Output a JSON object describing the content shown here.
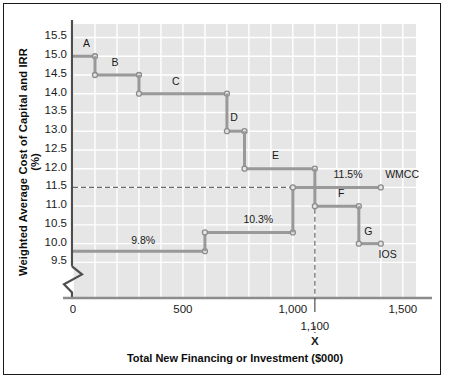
{
  "chart_data": {
    "type": "line",
    "title": "",
    "xlabel": "Total New Financing or Investment ($000)",
    "ylabel": "Weighted Average Cost of Capital and IRR (%)",
    "xlim": [
      0,
      1560
    ],
    "ylim": [
      9.3,
      15.7
    ],
    "xticks": [
      "0",
      "500",
      "1,000",
      "1,500"
    ],
    "xtick_values": [
      0,
      500,
      1000,
      1500
    ],
    "yticks": [
      "9.5",
      "10.0",
      "10.5",
      "11.0",
      "11.5",
      "12.0",
      "12.5",
      "13.0",
      "13.5",
      "14.0",
      "14.5",
      "15.0",
      "15.5"
    ],
    "ytick_values": [
      9.5,
      10.0,
      10.5,
      11.0,
      11.5,
      12.0,
      12.5,
      13.0,
      13.5,
      14.0,
      14.5,
      15.0,
      15.5
    ],
    "grid": true,
    "axis_break": true,
    "legend": "none",
    "series": [
      {
        "name": "IOS",
        "label": "IOS",
        "type": "step-down",
        "color": "#999999",
        "steps": [
          {
            "id": "A",
            "irr": 15.0,
            "x_start": 0,
            "x_end": 100
          },
          {
            "id": "B",
            "irr": 14.5,
            "x_start": 100,
            "x_end": 300
          },
          {
            "id": "C",
            "irr": 14.0,
            "x_start": 300,
            "x_end": 700
          },
          {
            "id": "D",
            "irr": 13.0,
            "x_start": 700,
            "x_end": 780
          },
          {
            "id": "E",
            "irr": 12.0,
            "x_start": 780,
            "x_end": 1100
          },
          {
            "id": "F",
            "irr": 11.0,
            "x_start": 1100,
            "x_end": 1300
          },
          {
            "id": "G",
            "irr": 10.0,
            "x_start": 1300,
            "x_end": 1400
          }
        ]
      },
      {
        "name": "WMCC",
        "label": "WMCC",
        "type": "step-up",
        "color": "#999999",
        "steps": [
          {
            "rate": 9.8,
            "rate_label": "9.8%",
            "x_start": 0,
            "x_end": 600
          },
          {
            "rate": 10.3,
            "rate_label": "10.3%",
            "x_start": 600,
            "x_end": 1000
          },
          {
            "rate": 11.5,
            "rate_label": "11.5%",
            "x_start": 1000,
            "x_end": 1400
          }
        ]
      }
    ],
    "intersection": {
      "x": 1100,
      "x_label": "1,100",
      "marker": "X",
      "y": 11.5,
      "guide_h": 11.5,
      "guide_v": 1100
    },
    "annotations": [
      {
        "text": "A",
        "x": 45,
        "y": 15.32
      },
      {
        "text": "B",
        "x": 175,
        "y": 14.82
      },
      {
        "text": "C",
        "x": 450,
        "y": 14.32
      },
      {
        "text": "D",
        "x": 715,
        "y": 13.35
      },
      {
        "text": "E",
        "x": 905,
        "y": 12.33
      },
      {
        "text": "F",
        "x": 1205,
        "y": 11.33
      },
      {
        "text": "G",
        "x": 1325,
        "y": 10.32
      },
      {
        "text": "9.8%",
        "x": 265,
        "y": 10.08
      },
      {
        "text": "10.3%",
        "x": 775,
        "y": 10.62
      },
      {
        "text": "11.5%",
        "x": 1185,
        "y": 11.82
      },
      {
        "text": "WMCC",
        "x": 1420,
        "y": 11.82
      },
      {
        "text": "IOS",
        "x": 1390,
        "y": 9.7
      }
    ]
  },
  "axes": {
    "x_title": "Total New Financing or Investment ($000)",
    "y_title": "Weighted Average Cost of Capital and IRR (%)"
  }
}
